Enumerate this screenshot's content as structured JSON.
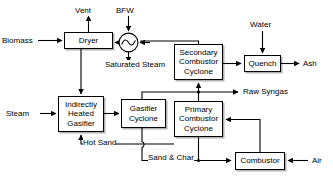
{
  "diagram": {
    "type": "process-flow-diagram",
    "line_color": "#000000",
    "box_fill": "#ffffff",
    "shadow_color": "#4d4d4d",
    "nodes": [
      {
        "id": "dryer",
        "label": "Dryer",
        "lines": [
          "Dryer"
        ],
        "x": 64,
        "y": 32,
        "w": 49,
        "h": 17
      },
      {
        "id": "heat-exchanger",
        "label": "Heat Exchanger",
        "lines": [],
        "x": 119,
        "y": 33,
        "w": 19,
        "h": 19
      },
      {
        "id": "secondary-combustor-cyclone",
        "label": "Secondary Combustor Cyclone",
        "lines": [
          "Secondary",
          "Combustor",
          "Cyclone"
        ],
        "x": 174,
        "y": 44,
        "w": 49,
        "h": 36
      },
      {
        "id": "quench",
        "label": "Quench",
        "lines": [
          "Quench"
        ],
        "x": 244,
        "y": 55,
        "w": 37,
        "h": 17
      },
      {
        "id": "indirectly-heated-gasifier",
        "label": "Indirectly Heated Gasifier",
        "lines": [
          "Indirectly",
          "Heated",
          "Gasifier"
        ],
        "x": 58,
        "y": 96,
        "w": 46,
        "h": 36
      },
      {
        "id": "gasifier-cyclone",
        "label": "Gasifier Cyclone",
        "lines": [
          "Gasifier",
          "Cyclone"
        ],
        "x": 121,
        "y": 99,
        "w": 45,
        "h": 29
      },
      {
        "id": "primary-combustor-cyclone",
        "label": "Primary Combustor Cyclone",
        "lines": [
          "Primary",
          "Combustor",
          "Cyclone"
        ],
        "x": 174,
        "y": 101,
        "w": 49,
        "h": 36
      },
      {
        "id": "combustor",
        "label": "Combustor",
        "lines": [
          "Combustor"
        ],
        "x": 235,
        "y": 152,
        "w": 50,
        "h": 18
      }
    ],
    "stream_labels": [
      {
        "id": "vent",
        "text": "Vent",
        "x": 75,
        "y": 7,
        "align": "center"
      },
      {
        "id": "bfw",
        "text": "BFW",
        "x": 116,
        "y": 7,
        "align": "center"
      },
      {
        "id": "water",
        "text": "Water",
        "x": 250,
        "y": 21,
        "align": "center"
      },
      {
        "id": "biomass",
        "text": "Biomass",
        "x": 3,
        "y": 36,
        "align": "left"
      },
      {
        "id": "ash",
        "text": "Ash",
        "x": 303,
        "y": 59,
        "align": "left"
      },
      {
        "id": "saturated-steam",
        "text": "Saturated Steam",
        "lines": [
          "Saturated",
          "Steam"
        ],
        "x": 107,
        "y": 60,
        "align": "center"
      },
      {
        "id": "raw-syngas",
        "text": "Raw Syngas",
        "x": 243,
        "y": 87,
        "align": "left"
      },
      {
        "id": "steam",
        "text": "Steam",
        "x": 7,
        "y": 109,
        "align": "left"
      },
      {
        "id": "hot-sand",
        "text": "Hot Sand",
        "x": 82,
        "y": 139,
        "align": "left"
      },
      {
        "id": "sand-char",
        "text": "Sand & Char",
        "x": 148,
        "y": 154,
        "align": "left"
      },
      {
        "id": "air",
        "text": "Air",
        "x": 312,
        "y": 156,
        "align": "left"
      }
    ],
    "connections": [
      {
        "id": "biomass-to-dryer",
        "from": "Biomass",
        "to": "Dryer"
      },
      {
        "id": "dryer-to-vent",
        "from": "Dryer",
        "to": "Vent"
      },
      {
        "id": "bfw-to-heat-exchanger",
        "from": "BFW",
        "to": "Heat Exchanger"
      },
      {
        "id": "heat-exchanger-to-saturated-steam",
        "from": "Heat Exchanger",
        "to": "Saturated Steam"
      },
      {
        "id": "heat-exchanger-to-dryer",
        "from": "Heat Exchanger",
        "to": "Dryer"
      },
      {
        "id": "secondary-cyclone-to-heat-exchanger",
        "from": "Secondary Combustor Cyclone",
        "to": "Heat Exchanger"
      },
      {
        "id": "dryer-to-gasifier",
        "from": "Dryer",
        "to": "Indirectly Heated Gasifier"
      },
      {
        "id": "steam-to-gasifier",
        "from": "Steam",
        "to": "Indirectly Heated Gasifier"
      },
      {
        "id": "gasifier-to-gasifier-cyclone",
        "from": "Indirectly Heated Gasifier",
        "to": "Gasifier Cyclone"
      },
      {
        "id": "gasifier-cyclone-to-raw-syngas",
        "from": "Gasifier Cyclone",
        "to": "Raw Syngas"
      },
      {
        "id": "gasifier-cyclone-to-sand-char",
        "from": "Gasifier Cyclone",
        "to": "Combustor"
      },
      {
        "id": "combustor-to-primary-cyclone",
        "from": "Combustor",
        "to": "Primary Combustor Cyclone"
      },
      {
        "id": "air-to-combustor",
        "from": "Air",
        "to": "Combustor"
      },
      {
        "id": "primary-cyclone-to-secondary-cyclone",
        "from": "Primary Combustor Cyclone",
        "to": "Secondary Combustor Cyclone"
      },
      {
        "id": "primary-cyclone-to-sand-char",
        "from": "Primary Combustor Cyclone",
        "to": "Combustor"
      },
      {
        "id": "hot-sand-to-gasifier",
        "from": "Primary Combustor Cyclone",
        "to": "Indirectly Heated Gasifier"
      },
      {
        "id": "secondary-cyclone-to-quench",
        "from": "Secondary Combustor Cyclone",
        "to": "Quench"
      },
      {
        "id": "water-to-quench",
        "from": "Water",
        "to": "Quench"
      },
      {
        "id": "quench-to-ash",
        "from": "Quench",
        "to": "Ash"
      }
    ]
  }
}
